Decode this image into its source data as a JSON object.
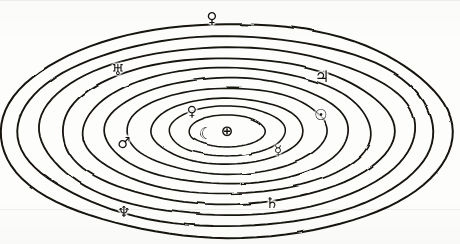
{
  "diagram": {
    "type": "concentric-ellipses",
    "background_color": "#fdfdfc",
    "stroke_color": "#15120f",
    "center_body": {
      "name": "Earth",
      "icon_name": "earth-symbol-icon",
      "glyph": "⊕",
      "x": 227,
      "y": 131,
      "size": 15
    },
    "orbits": [
      {
        "index": 1,
        "body": "Moon",
        "icon_name": "moon-symbol-icon",
        "glyph": "☾",
        "rx": 38,
        "ry": 16,
        "label_x": 206,
        "label_y": 134,
        "label_size": 16,
        "stroke_width": 1.5
      },
      {
        "index": 2,
        "body": "Mercury",
        "icon_name": "mercury-symbol-icon",
        "glyph": "☿",
        "rx": 58,
        "ry": 25,
        "label_x": 278,
        "label_y": 150,
        "label_size": 13,
        "stroke_width": 1.5
      },
      {
        "index": 3,
        "body": "Venus",
        "icon_name": "venus-symbol-icon",
        "glyph": "♀",
        "rx": 76,
        "ry": 33,
        "label_x": 192,
        "label_y": 111,
        "label_size": 14,
        "stroke_width": 1.6
      },
      {
        "index": 4,
        "body": "Sun",
        "icon_name": "sun-symbol-icon",
        "glyph": "☉",
        "rx": 100,
        "ry": 43,
        "label_x": 321,
        "label_y": 115,
        "label_size": 15,
        "stroke_width": 1.6
      },
      {
        "index": 5,
        "body": "Mars",
        "icon_name": "mars-symbol-icon",
        "glyph": "♂",
        "rx": 122,
        "ry": 53,
        "label_x": 124,
        "label_y": 143,
        "label_size": 15,
        "stroke_width": 1.7
      },
      {
        "index": 6,
        "body": "Jupiter",
        "icon_name": "jupiter-symbol-icon",
        "glyph": "♃",
        "rx": 144,
        "ry": 63,
        "label_x": 322,
        "label_y": 77,
        "label_size": 16,
        "stroke_width": 1.7
      },
      {
        "index": 7,
        "body": "Saturn",
        "icon_name": "saturn-symbol-icon",
        "glyph": "♄",
        "rx": 166,
        "ry": 73,
        "label_x": 272,
        "label_y": 203,
        "label_size": 15,
        "stroke_width": 1.8
      },
      {
        "index": 8,
        "body": "Uranus",
        "icon_name": "uranus-symbol-icon",
        "glyph": "♅",
        "rx": 188,
        "ry": 84,
        "label_x": 118,
        "label_y": 70,
        "label_size": 15,
        "stroke_width": 1.8
      },
      {
        "index": 9,
        "body": "Neptune",
        "icon_name": "neptune-symbol-icon",
        "glyph": "♆",
        "rx": 208,
        "ry": 95,
        "label_x": 124,
        "label_y": 212,
        "label_size": 15,
        "stroke_width": 1.9
      },
      {
        "index": 10,
        "body": "Pluto",
        "icon_name": "pluto-symbol-icon",
        "glyph": "♀",
        "rx": 226,
        "ry": 107,
        "label_x": 212,
        "label_y": 18,
        "label_size": 15,
        "stroke_width": 2.0
      }
    ]
  },
  "chart_data": {
    "type": "scatter",
    "xlabel": "",
    "ylabel": "",
    "categories": [
      "Moon",
      "Mercury",
      "Venus",
      "Sun",
      "Mars",
      "Jupiter",
      "Saturn",
      "Uranus",
      "Neptune",
      "Pluto"
    ],
    "values": [
      38,
      58,
      76,
      100,
      122,
      144,
      166,
      188,
      208,
      226
    ],
    "series": [
      {
        "name": "semi-major axis (px)",
        "values": [
          38,
          58,
          76,
          100,
          122,
          144,
          166,
          188,
          208,
          226
        ]
      },
      {
        "name": "semi-minor axis (px)",
        "values": [
          16,
          25,
          33,
          43,
          53,
          63,
          73,
          84,
          95,
          107
        ]
      }
    ],
    "annotations": [
      "Earth ⊕ at center",
      "Moon ☾",
      "Mercury ☿",
      "Venus ♀",
      "Sun ☉",
      "Mars ♂",
      "Jupiter ♃",
      "Saturn ♄",
      "Uranus ♅",
      "Neptune ♆",
      "Pluto ♀"
    ],
    "legend_position": "none",
    "grid": false
  }
}
